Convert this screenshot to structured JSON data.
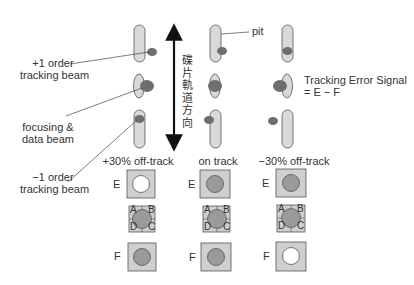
{
  "labels": {
    "plus1_beam": [
      "+1 order",
      "tracking beam"
    ],
    "focus_beam": [
      "focusing &",
      "data beam"
    ],
    "minus1_beam": [
      "−1 order",
      "tracking beam"
    ],
    "pit": "pit",
    "direction": "碟片軌道方向",
    "tes_line1": "Tracking Error Signal",
    "tes_line2": "= E − F"
  },
  "columns": [
    {
      "title": "+30% off-track",
      "E_spot": "white",
      "F_spot": "gray"
    },
    {
      "title": "on track",
      "E_spot": "gray",
      "F_spot": "gray"
    },
    {
      "title": "−30% off-track",
      "E_spot": "gray",
      "F_spot": "white"
    }
  ],
  "detector": {
    "E": "E",
    "F": "F",
    "quadrants": [
      "A",
      "B",
      "C",
      "D"
    ]
  },
  "colors": {
    "pit_fill": "#d9d9d9",
    "beam_fill": "#6e6e6e",
    "detector_fill": "#cfcfcf",
    "spot_gray": "#9a9a9a",
    "spot_white": "#ffffff",
    "stroke": "#555555"
  }
}
